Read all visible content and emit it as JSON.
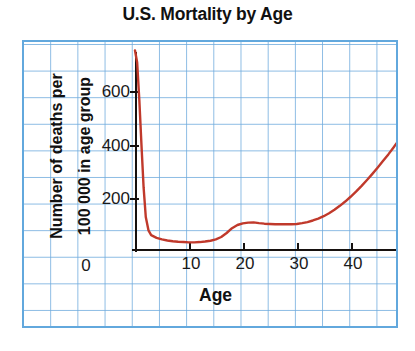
{
  "chart_data": {
    "type": "line",
    "title": "U.S. Mortality by Age",
    "xlabel": "Age",
    "ylabel_line1": "Number of deaths per",
    "ylabel_line2": "100 000 in age group",
    "xlim": [
      0,
      49
    ],
    "ylim": [
      0,
      760
    ],
    "xticks": [
      0,
      10,
      20,
      30,
      40
    ],
    "xtick_labels": [
      "0",
      "10",
      "20",
      "30",
      "40"
    ],
    "yticks": [
      0,
      200,
      400,
      600
    ],
    "ytick_labels": [
      "0",
      "200",
      "400",
      "600"
    ],
    "grid": true,
    "grid_style": "graph-paper",
    "legend": "none",
    "series": [
      {
        "name": "U.S. mortality rate",
        "color": "#c0392b",
        "x": [
          0,
          0.4,
          0.8,
          1.2,
          1.6,
          2,
          2.5,
          3,
          4,
          5,
          6,
          7,
          8,
          9,
          10,
          11,
          12,
          13,
          14,
          15,
          16,
          17,
          18,
          19,
          20,
          21,
          22,
          23,
          24,
          25,
          26,
          27,
          28,
          29,
          30,
          31,
          32,
          33,
          34,
          35,
          36,
          37,
          38,
          39,
          40,
          41,
          42,
          43,
          44,
          45,
          46,
          47,
          48,
          49
        ],
        "y": [
          745,
          700,
          560,
          390,
          230,
          120,
          70,
          52,
          42,
          36,
          32,
          29,
          27,
          26,
          25,
          25,
          26,
          28,
          31,
          36,
          45,
          60,
          78,
          90,
          96,
          99,
          100,
          97,
          95,
          94,
          93,
          93,
          93,
          93,
          94,
          97,
          101,
          107,
          114,
          123,
          134,
          147,
          162,
          178,
          196,
          215,
          236,
          258,
          281,
          305,
          330,
          355,
          382,
          410
        ]
      }
    ]
  },
  "colors": {
    "accent": "#c0392b",
    "grid": "#6eaadd",
    "border": "#62a8dd",
    "axis": "#16110f",
    "text": "#111111"
  }
}
